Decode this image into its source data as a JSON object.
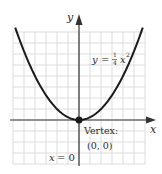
{
  "chart_data": {
    "type": "line",
    "title": "",
    "equation_label": "y = ¼ x²",
    "equation": {
      "lhs": "y",
      "eq": "=",
      "frac_num": "1",
      "frac_den": "4",
      "var": "x",
      "exp": "2"
    },
    "xlabel": "x",
    "ylabel": "y",
    "xlim": [
      -6,
      6
    ],
    "ylim": [
      -4,
      8
    ],
    "grid": true,
    "series": [
      {
        "name": "y = 1/4 x^2",
        "x": [
          -6,
          -5,
          -4,
          -3,
          -2,
          -1,
          0,
          1,
          2,
          3,
          4,
          5,
          6
        ],
        "values": [
          9,
          6.25,
          4,
          2.25,
          1,
          0.25,
          0,
          0.25,
          1,
          2.25,
          4,
          6.25,
          9
        ]
      }
    ],
    "annotations": [
      {
        "text": "Vertex:",
        "point": [
          0,
          0
        ]
      },
      {
        "text": "(0, 0)",
        "point": [
          0,
          0
        ]
      },
      {
        "text": "x = 0",
        "note": "axis of symmetry"
      }
    ]
  },
  "labels": {
    "y_axis": "y",
    "x_axis": "x",
    "vertex_title": "Vertex:",
    "vertex_coords": "(0, 0)",
    "symmetry_axis": "x = 0",
    "eq_y": "y",
    "eq_equals": "=",
    "eq_num": "1",
    "eq_den": "4",
    "eq_x": "x",
    "eq_exp": "2"
  },
  "colors": {
    "curve": "#1a1a1a",
    "axis": "#333333",
    "grid": "#d4d4d4"
  }
}
